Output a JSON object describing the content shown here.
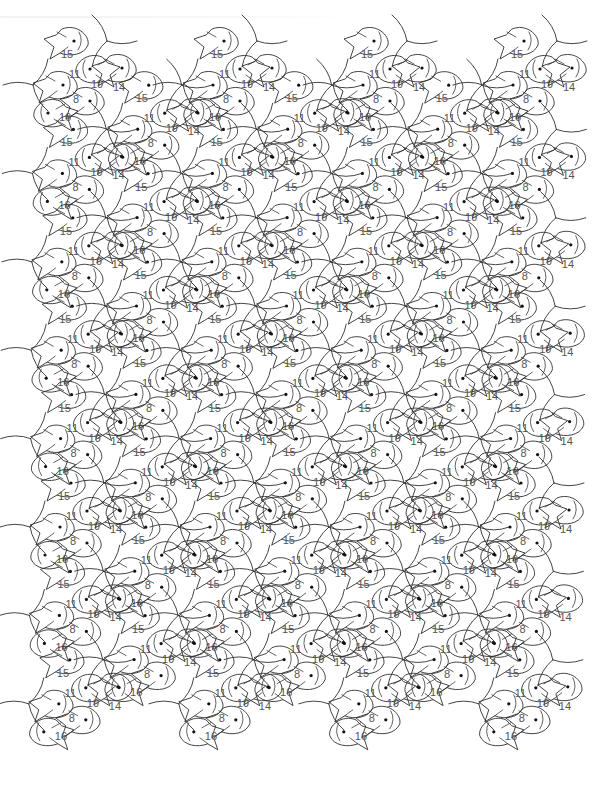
{
  "page": {
    "background": "#ffffff",
    "line_color": "#2f2f2f",
    "label_color": "#555555"
  },
  "tiling": {
    "lattice": {
      "a": [
        150,
        0
      ],
      "b": [
        74.7,
        44.2
      ]
    },
    "origin": [
      76,
      99
    ],
    "rows": 15,
    "x_min": 30,
    "x_max": 585,
    "fish_labels": [
      "8",
      "16",
      "11",
      "15",
      "19",
      "14"
    ],
    "motif": {
      "labels": [
        {
          "text": "8",
          "dx": 0,
          "dy": 0
        },
        {
          "text": "16",
          "dx": -14,
          "dy": 18
        },
        {
          "text": "11",
          "dx": -4,
          "dy": -25
        },
        {
          "text": "15",
          "dx": -12,
          "dy": -45
        },
        {
          "text": "19",
          "dx": 18,
          "dy": -15
        },
        {
          "text": "14",
          "dx": 40,
          "dy": -12
        }
      ],
      "eyes": [
        {
          "dx": 14,
          "dy": 2
        },
        {
          "dx": -28,
          "dy": 14
        },
        {
          "dx": -13,
          "dy": -14
        },
        {
          "dx": -2,
          "dy": -58
        },
        {
          "dx": 14,
          "dy": -30
        },
        {
          "dx": 46,
          "dy": -31
        }
      ],
      "pinwheels": [
        {
          "dx": 31,
          "dy": -58
        },
        {
          "dx": -43,
          "dy": -14
        }
      ]
    }
  }
}
